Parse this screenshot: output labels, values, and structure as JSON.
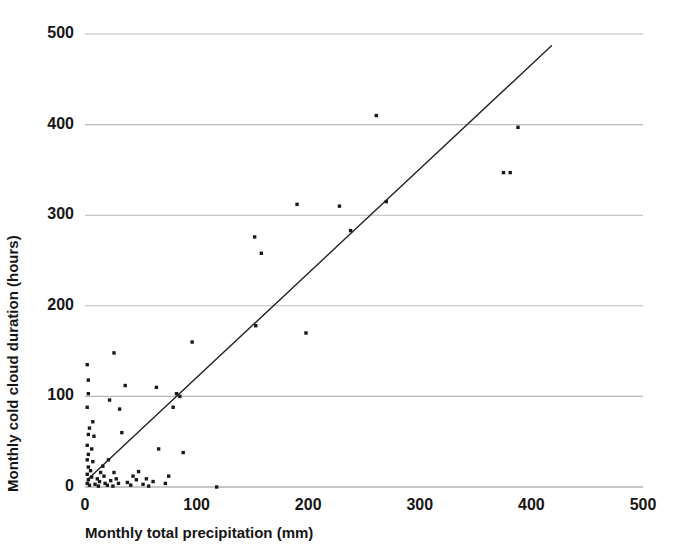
{
  "chart_data": {
    "type": "scatter",
    "title": "",
    "xlabel": "Monthly total precipitation (mm)",
    "ylabel": "Monthly cold cloud duration (hours)",
    "xlim": [
      0,
      500
    ],
    "ylim": [
      0,
      500
    ],
    "xticks": [
      0,
      100,
      200,
      300,
      400,
      500
    ],
    "yticks": [
      0,
      100,
      200,
      300,
      400,
      500
    ],
    "xtick_labels": [
      "0",
      "100",
      "200",
      "300",
      "400",
      "500"
    ],
    "ytick_labels": [
      "0",
      "100",
      "200",
      "300",
      "400",
      "500"
    ],
    "grid": "horizontal",
    "grid_color": "#b9b9b9",
    "legend": "none",
    "marker_color": "#1a1a1a",
    "marker_size_px": 3.4,
    "series": [
      {
        "name": "Monthly observations",
        "points": [
          [
            2,
            135
          ],
          [
            3,
            118
          ],
          [
            3,
            103
          ],
          [
            2,
            88
          ],
          [
            4,
            65
          ],
          [
            3,
            58
          ],
          [
            2,
            46
          ],
          [
            3,
            36
          ],
          [
            2,
            30
          ],
          [
            3,
            22
          ],
          [
            2,
            14
          ],
          [
            3,
            8
          ],
          [
            2,
            4
          ],
          [
            4,
            2
          ],
          [
            6,
            11
          ],
          [
            5,
            18
          ],
          [
            7,
            28
          ],
          [
            6,
            42
          ],
          [
            8,
            56
          ],
          [
            7,
            72
          ],
          [
            9,
            3
          ],
          [
            11,
            9
          ],
          [
            12,
            1
          ],
          [
            14,
            16
          ],
          [
            13,
            6
          ],
          [
            16,
            23
          ],
          [
            18,
            4
          ],
          [
            17,
            12
          ],
          [
            21,
            30
          ],
          [
            20,
            2
          ],
          [
            23,
            7
          ],
          [
            26,
            16
          ],
          [
            25,
            1
          ],
          [
            28,
            9
          ],
          [
            30,
            4
          ],
          [
            22,
            96
          ],
          [
            26,
            148
          ],
          [
            31,
            86
          ],
          [
            33,
            60
          ],
          [
            36,
            112
          ],
          [
            38,
            5
          ],
          [
            41,
            2
          ],
          [
            43,
            12
          ],
          [
            46,
            8
          ],
          [
            48,
            17
          ],
          [
            52,
            3
          ],
          [
            55,
            9
          ],
          [
            57,
            1
          ],
          [
            61,
            6
          ],
          [
            64,
            110
          ],
          [
            66,
            42
          ],
          [
            72,
            4
          ],
          [
            75,
            12
          ],
          [
            79,
            88
          ],
          [
            82,
            103
          ],
          [
            85,
            100
          ],
          [
            88,
            38
          ],
          [
            96,
            160
          ],
          [
            118,
            0
          ],
          [
            152,
            276
          ],
          [
            158,
            258
          ],
          [
            153,
            178
          ],
          [
            190,
            312
          ],
          [
            198,
            170
          ],
          [
            228,
            310
          ],
          [
            238,
            283
          ],
          [
            261,
            410
          ],
          [
            270,
            315
          ],
          [
            375,
            347
          ],
          [
            381,
            347
          ],
          [
            388,
            397
          ]
        ]
      }
    ],
    "trendline": {
      "name": "regression line",
      "x_start": 3,
      "y_start": 9,
      "x_end": 418,
      "y_end": 487,
      "color": "#262626",
      "width_px": 1.4
    }
  }
}
